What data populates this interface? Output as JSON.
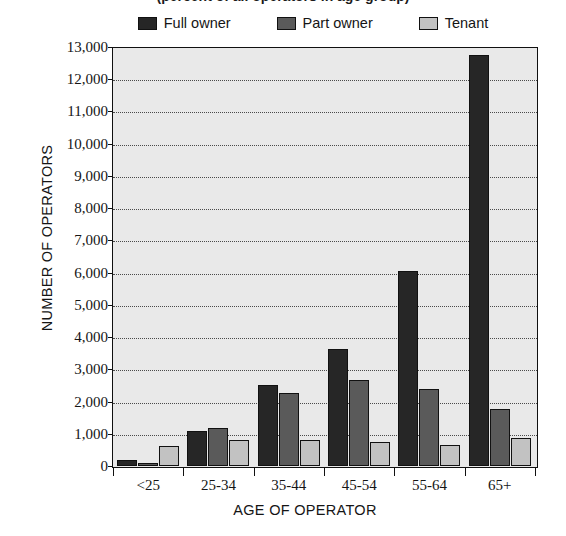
{
  "chart_data": {
    "type": "bar",
    "title": "(percent of all operators in age group)",
    "title_note": "title is cropped off at the top edge of the screenshot",
    "xlabel": "AGE OF OPERATOR",
    "ylabel": "NUMBER OF OPERATORS",
    "categories": [
      "<25",
      "25-34",
      "35-44",
      "45-54",
      "55-64",
      "65+"
    ],
    "series": [
      {
        "name": "Full owner",
        "color": "#262626",
        "values": [
          200,
          1080,
          2500,
          3620,
          6050,
          12750
        ]
      },
      {
        "name": "Part owner",
        "color": "#5a5a5a",
        "values": [
          100,
          1170,
          2250,
          2660,
          2380,
          1780
        ]
      },
      {
        "name": "Tenant",
        "color": "#c2c2c2",
        "values": [
          610,
          800,
          820,
          730,
          640,
          870
        ]
      }
    ],
    "ylim": [
      0,
      13000
    ],
    "ytick_step": 1000,
    "ytick_labels": [
      "0",
      "1,000",
      "2,000",
      "3,000",
      "4,000",
      "5,000",
      "6,000",
      "7,000",
      "8,000",
      "9,000",
      "10,000",
      "11,000",
      "12,000",
      "13,000"
    ],
    "grid": true,
    "grid_style": "dotted-horizontal",
    "legend_position": "top",
    "plot_background": "#e9e9e9",
    "axis_color": "#101010"
  }
}
